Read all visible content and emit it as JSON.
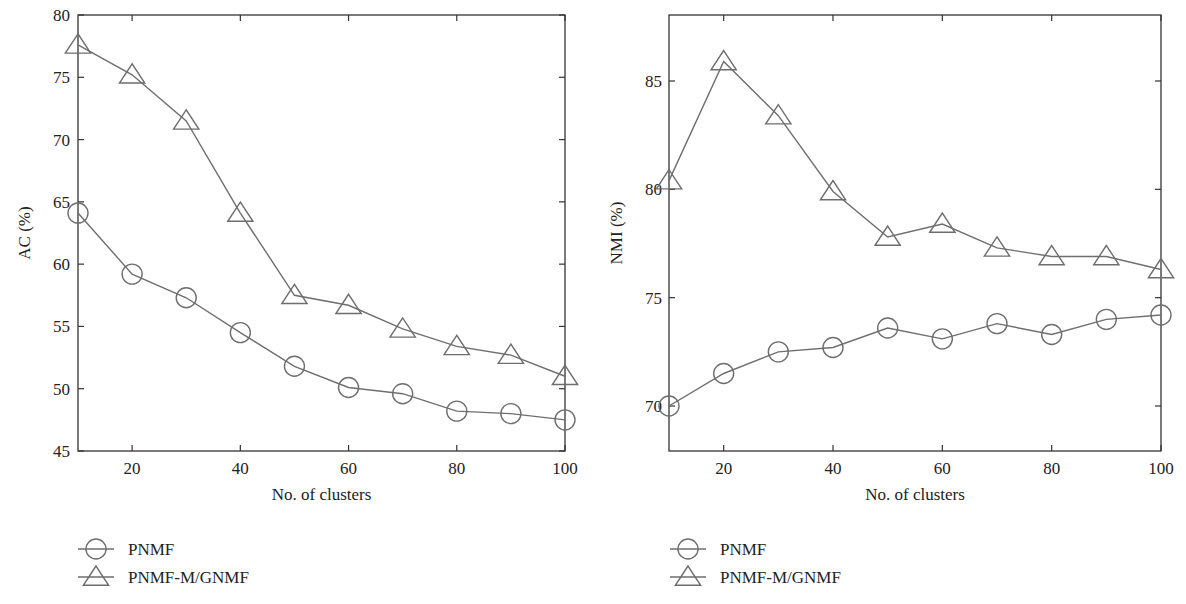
{
  "colors": {
    "line": "#6e6e6e",
    "axis": "#333333",
    "text": "#222222",
    "background": "#ffffff"
  },
  "legend": [
    {
      "label": "PNMF",
      "marker": "circle"
    },
    {
      "label": "PNMF-M/GNMF",
      "marker": "triangle"
    }
  ],
  "chart_data": [
    {
      "type": "line",
      "title": "",
      "xlabel": "No. of clusters",
      "ylabel": "AC (%)",
      "x": [
        10,
        20,
        30,
        40,
        50,
        60,
        70,
        80,
        90,
        100
      ],
      "xlim": [
        10,
        100
      ],
      "ylim": [
        45,
        80
      ],
      "xticks": [
        20,
        40,
        60,
        80,
        100
      ],
      "yticks": [
        45,
        50,
        55,
        60,
        65,
        70,
        75,
        80
      ],
      "grid": false,
      "legend_position": "below",
      "series": [
        {
          "name": "PNMF",
          "marker": "circle",
          "values": [
            64.1,
            59.2,
            57.3,
            54.5,
            51.8,
            50.1,
            49.6,
            48.2,
            48.0,
            47.5
          ]
        },
        {
          "name": "PNMF-M/GNMF",
          "marker": "triangle",
          "values": [
            77.6,
            75.2,
            71.5,
            64.1,
            57.5,
            56.7,
            54.8,
            53.4,
            52.7,
            51.0
          ]
        }
      ]
    },
    {
      "type": "line",
      "title": "",
      "xlabel": "No. of clusters",
      "ylabel": "NMI (%)",
      "x": [
        10,
        20,
        30,
        40,
        50,
        60,
        70,
        80,
        90,
        100
      ],
      "xlim": [
        10,
        100
      ],
      "ylim": [
        68,
        88
      ],
      "xticks": [
        20,
        40,
        60,
        80,
        100
      ],
      "yticks": [
        70,
        75,
        80,
        85
      ],
      "grid": false,
      "legend_position": "below",
      "series": [
        {
          "name": "PNMF",
          "marker": "circle",
          "values": [
            70.0,
            71.5,
            72.5,
            72.7,
            73.6,
            73.1,
            73.8,
            73.3,
            74.0,
            74.2
          ]
        },
        {
          "name": "PNMF-M/GNMF",
          "marker": "triangle",
          "values": [
            80.4,
            85.9,
            83.4,
            79.9,
            77.8,
            78.4,
            77.3,
            76.9,
            76.9,
            76.3
          ]
        }
      ]
    }
  ]
}
